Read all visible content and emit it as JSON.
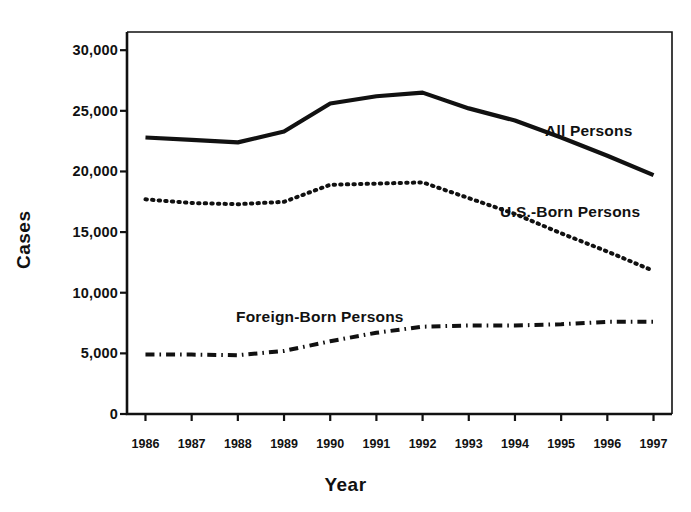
{
  "chart_data": {
    "type": "line",
    "title": "",
    "xlabel": "Year",
    "ylabel": "Cases",
    "x": [
      1986,
      1987,
      1988,
      1989,
      1990,
      1991,
      1992,
      1993,
      1994,
      1995,
      1996,
      1997
    ],
    "xtick_labels": [
      "1986",
      "1987",
      "1988",
      "1989",
      "1990",
      "1991",
      "1992",
      "1993",
      "1994",
      "1995",
      "1996",
      "1997"
    ],
    "ytick_values": [
      0,
      5000,
      10000,
      15000,
      20000,
      25000,
      30000
    ],
    "ytick_labels": [
      "0",
      "5,000",
      "10,000",
      "15,000",
      "20,000",
      "25,000",
      "30,000"
    ],
    "ylim": [
      0,
      31500
    ],
    "xlim": [
      1985.6,
      1997.4
    ],
    "grid": false,
    "legend_position": "inline-annotations",
    "series": [
      {
        "name": "All Persons",
        "style": "solid",
        "color": "#111111",
        "values": [
          22800,
          22600,
          22400,
          23300,
          25600,
          26200,
          26500,
          25200,
          24200,
          22800,
          21300,
          19700
        ]
      },
      {
        "name": "U.S.-Born Persons",
        "style": "dotted",
        "color": "#111111",
        "values": [
          17700,
          17400,
          17300,
          17500,
          18900,
          19000,
          19100,
          17800,
          16500,
          14900,
          13400,
          11800
        ]
      },
      {
        "name": "Foreign-Born Persons",
        "style": "dash-dot",
        "color": "#111111",
        "values": [
          4900,
          4900,
          4850,
          5200,
          6000,
          6700,
          7200,
          7300,
          7300,
          7400,
          7600,
          7600
        ]
      }
    ],
    "annotations": [
      {
        "text": "All Persons",
        "x_px": 545,
        "y_px": 122
      },
      {
        "text": "U.S.-Born Persons",
        "x_px": 500,
        "y_px": 203
      },
      {
        "text": "Foreign-Born Persons",
        "x_px": 236,
        "y_px": 308
      }
    ]
  },
  "axes": {
    "ylabel": "Cases",
    "xlabel": "Year"
  }
}
